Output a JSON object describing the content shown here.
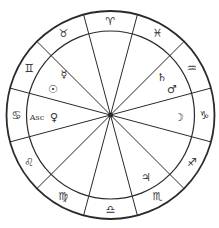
{
  "chart": {
    "center": [
      110.5,
      115
    ],
    "outer_radius": 104,
    "inner_radius": 84,
    "hub_radius": 2.5,
    "colors": {
      "line": "#2a2a2a",
      "text": "#333333",
      "background": "#ffffff"
    }
  },
  "spokes_deg": [
    105,
    75,
    45,
    15,
    -15,
    -45,
    -75,
    -105,
    -135,
    -165,
    165,
    135
  ],
  "signs": [
    {
      "name": "Aries",
      "glyph": "♈︎",
      "angle": 90
    },
    {
      "name": "Pisces",
      "glyph": "♓︎",
      "angle": 60
    },
    {
      "name": "Aquarius",
      "glyph": "♒︎",
      "angle": 30
    },
    {
      "name": "Capricorn",
      "glyph": "♑︎",
      "angle": 0
    },
    {
      "name": "Sagittarius",
      "glyph": "♐︎",
      "angle": -30
    },
    {
      "name": "Scorpio",
      "glyph": "♏︎",
      "angle": -60
    },
    {
      "name": "Libra",
      "glyph": "♎︎",
      "angle": -90
    },
    {
      "name": "Virgo",
      "glyph": "♍︎",
      "angle": -120
    },
    {
      "name": "Leo",
      "glyph": "♌︎",
      "angle": -150
    },
    {
      "name": "Cancer",
      "glyph": "♋︎",
      "angle": 180
    },
    {
      "name": "Gemini",
      "glyph": "♊︎",
      "angle": 150
    },
    {
      "name": "Taurus",
      "glyph": "♉︎",
      "angle": 120
    }
  ],
  "planets": [
    {
      "name": "Mercury",
      "glyph": "☿︎",
      "x": 64,
      "y": 74
    },
    {
      "name": "Sun",
      "glyph": "☉︎",
      "x": 53,
      "y": 89
    },
    {
      "name": "Saturn",
      "glyph": "♄︎",
      "x": 162,
      "y": 77
    },
    {
      "name": "Mars",
      "glyph": "♂︎",
      "x": 172,
      "y": 89
    },
    {
      "name": "Moon",
      "glyph": "☽︎",
      "x": 179,
      "y": 117
    },
    {
      "name": "Venus",
      "glyph": "♀︎",
      "x": 54,
      "y": 117
    },
    {
      "name": "Jupiter",
      "glyph": "♃︎",
      "x": 146,
      "y": 177
    }
  ],
  "ascendant": {
    "label": "Asc",
    "x": 37,
    "y": 117
  }
}
